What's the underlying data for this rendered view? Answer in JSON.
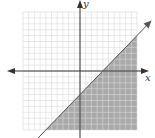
{
  "chart_data": {
    "type": "line",
    "title": "",
    "xlabel": "x",
    "ylabel": "y",
    "xlim": [
      -10,
      10
    ],
    "ylim": [
      -10,
      10
    ],
    "grid": true,
    "grid_step": 1,
    "boundary_line": {
      "slope": 1,
      "intercept": -4,
      "style": "solid",
      "equation": "y = x - 4"
    },
    "shaded_region": "below",
    "inequality": "y <= x - 4",
    "x_intercept": 4,
    "y_intercept": -4
  },
  "labels": {
    "x_axis": "x",
    "y_axis": "y"
  },
  "colors": {
    "shade": "#a9a9a9",
    "grid": "#d9d9d9",
    "axis": "#333333",
    "line": "#555555"
  }
}
